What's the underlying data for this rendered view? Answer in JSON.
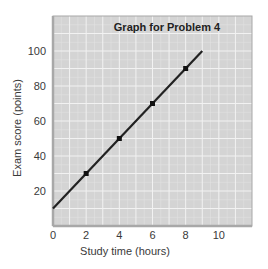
{
  "chart_data": {
    "type": "line",
    "title": "Graph for Problem 4",
    "xlabel": "Study time (hours)",
    "ylabel": "Exam score (points)",
    "xlim": [
      0,
      12
    ],
    "ylim": [
      0,
      120
    ],
    "x_ticks": [
      0,
      2,
      4,
      6,
      8,
      10
    ],
    "y_ticks": [
      20,
      40,
      60,
      80,
      100
    ],
    "x_tick_labels": [
      "0",
      "2",
      "4",
      "6",
      "8",
      "10"
    ],
    "y_tick_labels": [
      "20",
      "40",
      "60",
      "80",
      "100"
    ],
    "grid": true,
    "legend": null,
    "series": [
      {
        "name": "Exam score vs study time",
        "line": {
          "x": [
            0,
            9
          ],
          "y": [
            10,
            100
          ]
        },
        "points": {
          "x": [
            2,
            4,
            6,
            8
          ],
          "y": [
            30,
            50,
            70,
            90
          ]
        },
        "equation": "y = 10x + 10"
      }
    ],
    "colors": {
      "plot_background": "#d4d4d4",
      "grid_major": "#f2f2f2",
      "grid_minor": "#e2e2e2",
      "frame": "#a8a8a8",
      "line": "#222222",
      "marker": "#111111"
    }
  }
}
